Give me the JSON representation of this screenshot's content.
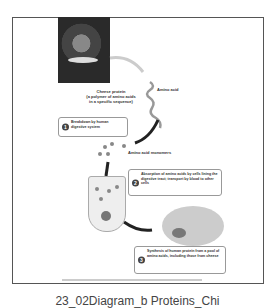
{
  "figure": {
    "title_caption": "23_02Diagram_b  Proteins_Chi",
    "photo_alt": "person-eating-cheese-photo",
    "labels": {
      "cheese_protein": [
        "Cheese protein",
        "(a polymer of amino acids",
        "in a specific sequence)"
      ],
      "amino_acid": "Amino acid",
      "amino_acid_monomers": "Amino acid monomers"
    },
    "steps": [
      {
        "number": "1",
        "text": "Breakdown by human digestive system"
      },
      {
        "number": "2",
        "text": "Absorption of amino acids by cells lining the digestive tract; transport by blood to other cells"
      },
      {
        "number": "3",
        "text": "Synthesis of human protein from a pool of amino acids, including those from cheese"
      }
    ],
    "copyright": "Copyright © Pearson Education, Inc., publishing as Pearson Benjamin Cummings. All rights reserved."
  }
}
